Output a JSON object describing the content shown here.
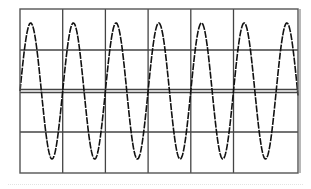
{
  "chart_data": {
    "type": "line",
    "title": "",
    "xlabel": "",
    "ylabel": "",
    "grid": true,
    "divisions": {
      "horizontal": 6,
      "vertical": 4
    },
    "xlim": [
      0,
      6.5
    ],
    "ylim": [
      -2,
      2
    ],
    "series": [
      {
        "name": "sine",
        "waveform": "sine",
        "amplitude_div": 1.6,
        "offset_div": 0,
        "period_div": 1.0,
        "cycles_visible": 6.5,
        "peaks_x_div": [
          0.25,
          1.25,
          2.25,
          3.25,
          4.25,
          5.25,
          6.25
        ],
        "troughs_x_div": [
          0.75,
          1.75,
          2.75,
          3.75,
          4.75,
          5.75
        ]
      }
    ],
    "reference_line": {
      "y": 0,
      "style": "double"
    }
  },
  "colors": {
    "background": "#ffffff",
    "grid": "#444444",
    "frame": "#555555",
    "trace": "#111111"
  }
}
